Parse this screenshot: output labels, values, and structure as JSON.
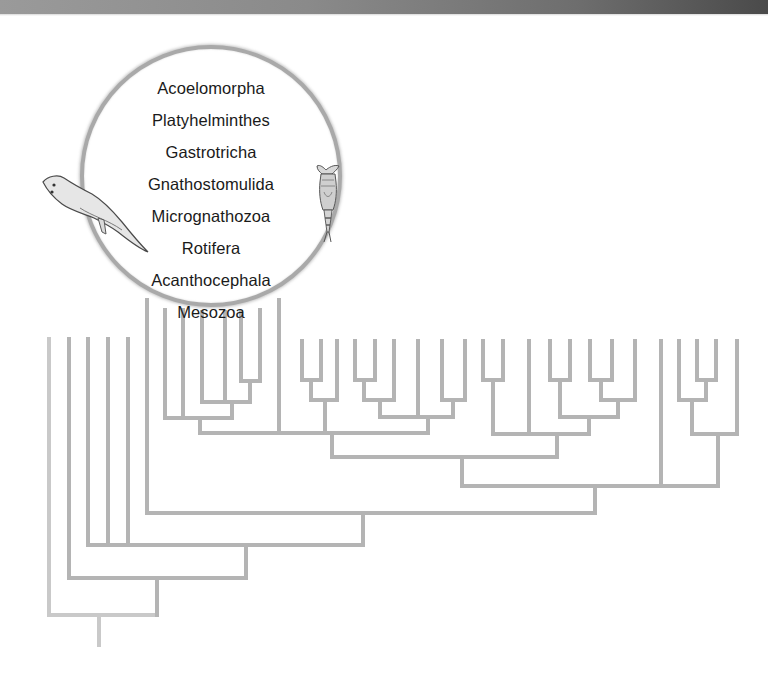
{
  "figure": {
    "type": "phylogenetic-tree",
    "highlighted_clade": {
      "taxa": [
        "Acoelomorpha",
        "Platyhelminthes",
        "Gastrotricha",
        "Gnathostomulida",
        "Micrognathozoa",
        "Rotifera",
        "Acanthocephala",
        "Mesozoa"
      ],
      "illustrations": [
        "flatworm-illustration",
        "rotifer-illustration"
      ]
    },
    "colors": {
      "branch": "#b4b4b4",
      "branch_light": "#c9c9c9",
      "circle_border": "#a9a9a9",
      "text": "#1a1a1a",
      "header_bar_start": "#9a9a9a",
      "header_bar_end": "#4a4a4a"
    },
    "leaf_count": 37
  }
}
